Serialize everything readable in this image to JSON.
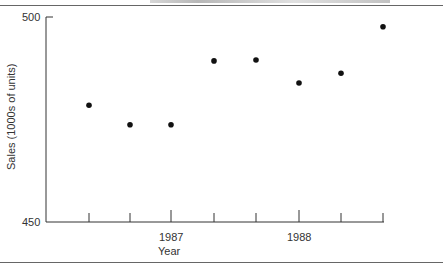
{
  "chart_data": {
    "type": "scatter",
    "title": "",
    "xlabel": "Year",
    "ylabel": "Sales (1000s of units)",
    "ylim": [
      450,
      500
    ],
    "y_ticks": [
      450,
      500
    ],
    "x_tick_labels": [
      {
        "label": "1987",
        "index": 2
      },
      {
        "label": "1988",
        "index": 5
      }
    ],
    "grid": false,
    "legend": null,
    "x": [
      "1986 Q3",
      "1986 Q4",
      "1987 Q1",
      "1987 Q2",
      "1987 Q3",
      "1987 Q4",
      "1988 Q1",
      "1988 Q2"
    ],
    "values": [
      478.5,
      473.7,
      473.7,
      489.3,
      489.5,
      483.9,
      486.3,
      497.6
    ]
  },
  "axes": {
    "y_top_label": "500",
    "y_bottom_label": "450",
    "x_label_1987": "1987",
    "x_label_1988": "1988",
    "x_title": "Year",
    "y_title": "Sales (1000s of units)"
  },
  "colors": {
    "axis": "#333333",
    "point": "#111111"
  }
}
